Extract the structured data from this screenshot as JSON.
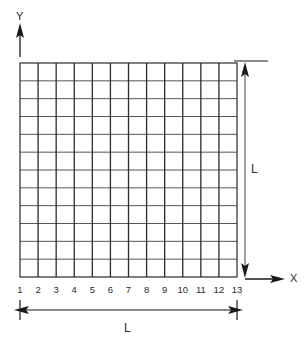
{
  "figure": {
    "axes": {
      "y_label": "Y",
      "x_label": "X"
    },
    "grid": {
      "columns": 12,
      "rows": 12,
      "line_color_vertical": "#2a2a2a",
      "line_color_horizontal": "#555555",
      "fill_color": "#ffffff",
      "left_px": 20,
      "top_px": 63,
      "right_px": 237,
      "bottom_px": 277
    },
    "x_tick_labels": [
      "1",
      "2",
      "3",
      "4",
      "5",
      "6",
      "7",
      "8",
      "9",
      "10",
      "11",
      "12",
      "13"
    ],
    "dimensions": {
      "horizontal_label": "L",
      "vertical_label": "L"
    },
    "colors": {
      "stroke": "#1a1a1a",
      "text": "#2b2b2b",
      "background": "#ffffff"
    }
  }
}
